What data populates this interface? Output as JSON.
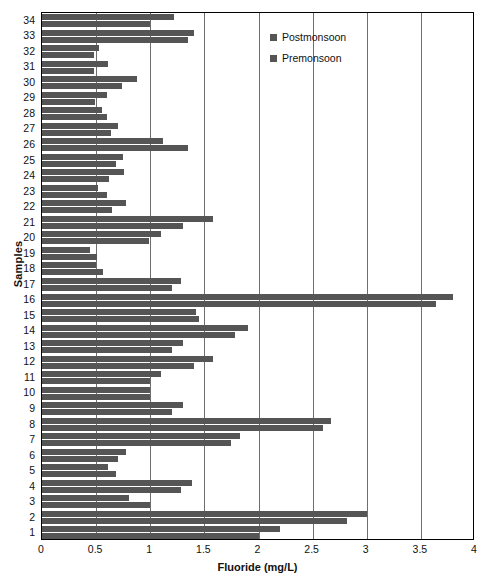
{
  "chart_data": {
    "type": "bar",
    "orientation": "horizontal",
    "title": "",
    "xlabel": "Fluoride (mg/L)",
    "ylabel": "Samples",
    "xlim": [
      0,
      4
    ],
    "xticks": [
      "0",
      "0.5",
      "1",
      "1.5",
      "2",
      "2.5",
      "3",
      "3.5",
      "4"
    ],
    "xtick_values": [
      0,
      0.5,
      1,
      1.5,
      2,
      2.5,
      3,
      3.5,
      4
    ],
    "grid": true,
    "legend_position": "top-right",
    "categories": [
      "1",
      "2",
      "3",
      "4",
      "5",
      "6",
      "7",
      "8",
      "9",
      "10",
      "11",
      "12",
      "13",
      "14",
      "15",
      "16",
      "17",
      "18",
      "19",
      "20",
      "21",
      "22",
      "23",
      "24",
      "25",
      "26",
      "27",
      "28",
      "29",
      "30",
      "31",
      "32",
      "33",
      "34"
    ],
    "series": [
      {
        "name": "Postmonsoon",
        "color": "#555555",
        "values": [
          2.2,
          3.0,
          0.8,
          1.39,
          0.61,
          0.78,
          1.83,
          2.67,
          1.3,
          1.0,
          1.1,
          1.58,
          1.3,
          1.9,
          1.42,
          3.8,
          1.28,
          0.5,
          0.44,
          1.1,
          1.58,
          0.78,
          0.52,
          0.76,
          0.75,
          1.12,
          0.7,
          0.55,
          0.6,
          0.88,
          0.61,
          0.53,
          1.4,
          1.22
        ]
      },
      {
        "name": "Premonsoon",
        "color": "#555555",
        "values": [
          2.0,
          2.82,
          1.0,
          1.28,
          0.68,
          0.7,
          1.75,
          2.6,
          1.2,
          1.0,
          1.0,
          1.4,
          1.2,
          1.78,
          1.45,
          3.64,
          1.2,
          0.56,
          0.51,
          0.99,
          1.3,
          0.65,
          0.6,
          0.62,
          0.68,
          1.35,
          0.64,
          0.6,
          0.49,
          0.74,
          0.48,
          0.48,
          1.35,
          1.0
        ]
      }
    ]
  }
}
